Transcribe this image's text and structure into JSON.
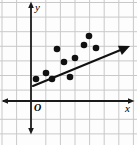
{
  "figure": {
    "width": 137,
    "height": 145,
    "background_color": "#fdfdfd",
    "labels": {
      "y_axis": "y",
      "x_axis": "x",
      "origin": "O"
    }
  },
  "chart_data": {
    "type": "scatter",
    "title": "",
    "xlabel": "x",
    "ylabel": "y",
    "subtitle": "",
    "legend": [],
    "legend_position": "none",
    "grid": true,
    "grid_color": "#c9c9c9",
    "grid_spacing_px": 14.6,
    "axis_color": "#1a1a1a",
    "point_color": "#111111",
    "line_color": "#111111",
    "origin_label": "O",
    "axes": {
      "x_axis_y_px": 101,
      "y_axis_x_px": 31,
      "x_arrow_left_px": 2,
      "x_arrow_right_px": 134,
      "y_arrow_top_px": 2,
      "y_arrow_bottom_px": 134,
      "xlim": [
        -2,
        7
      ],
      "ylim": [
        -1,
        7
      ],
      "tick_labels_x": [],
      "tick_labels_y": []
    },
    "annotations": [
      {
        "text": "O",
        "x_px": 37,
        "y_px": 108,
        "note": "origin label"
      },
      {
        "text": "y",
        "x_px": 37,
        "y_px": 8,
        "note": "vertical axis label"
      },
      {
        "text": "x",
        "x_px": 128,
        "y_px": 108,
        "note": "horizontal axis label"
      }
    ],
    "points_px": [
      {
        "x": 36,
        "y": 79
      },
      {
        "x": 46,
        "y": 73
      },
      {
        "x": 52,
        "y": 79
      },
      {
        "x": 57,
        "y": 49
      },
      {
        "x": 64,
        "y": 62
      },
      {
        "x": 70,
        "y": 77
      },
      {
        "x": 75,
        "y": 58
      },
      {
        "x": 84,
        "y": 45
      },
      {
        "x": 89,
        "y": 36
      },
      {
        "x": 96,
        "y": 48
      }
    ],
    "x": [
      0.3,
      1.0,
      1.4,
      1.8,
      2.3,
      2.7,
      3.0,
      3.6,
      4.0,
      4.5
    ],
    "y": [
      1.5,
      1.9,
      1.5,
      3.6,
      2.7,
      1.6,
      2.9,
      3.8,
      4.5,
      3.6
    ],
    "trend_line": {
      "start_px": {
        "x": 33,
        "y": 86
      },
      "end_px": {
        "x": 123,
        "y": 49
      },
      "arrow_end_px": {
        "x": 130,
        "y": 46
      },
      "slope_px": -0.41,
      "has_arrow_head": true
    }
  }
}
